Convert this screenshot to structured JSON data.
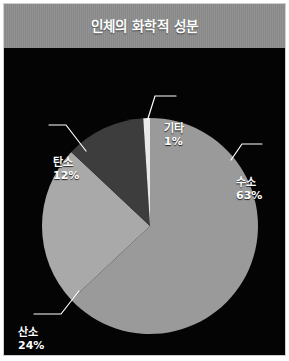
{
  "header": {
    "title": "인체의 화학적 성분"
  },
  "colors": {
    "header_band": "#8e8e8e",
    "plot_background": "#040404",
    "frame_border": "#cfcfcf",
    "label_text": "#ffffff",
    "leader_line": "#ffffff",
    "hydrogen": "#9a9a9a",
    "oxygen": "#a9a9a9",
    "carbon": "#3d3d3d",
    "other": "#e9e9e9"
  },
  "chart_data": {
    "type": "pie",
    "title": "인체의 화학적 성분",
    "xlabel": "",
    "ylabel": "",
    "legend_position": "none",
    "labels_outside": true,
    "start_angle_deg": 0,
    "direction": "clockwise",
    "categories": [
      "수소",
      "산소",
      "탄소",
      "기타"
    ],
    "values": [
      63,
      24,
      12,
      1
    ],
    "unit": "%",
    "slices": [
      {
        "label": "수소",
        "value": 63,
        "value_text": "63%",
        "color": "#9a9a9a"
      },
      {
        "label": "산소",
        "value": 24,
        "value_text": "24%",
        "color": "#a9a9a9"
      },
      {
        "label": "탄소",
        "value": 12,
        "value_text": "12%",
        "color": "#3d3d3d"
      },
      {
        "label": "기타",
        "value": 1,
        "value_text": "1%",
        "color": "#e9e9e9"
      }
    ]
  },
  "labels": {
    "hydrogen": {
      "name": "수소",
      "pct": "63%"
    },
    "oxygen": {
      "name": "산소",
      "pct": "24%"
    },
    "carbon": {
      "name": "탄소",
      "pct": "12%"
    },
    "other": {
      "name": "기타",
      "pct": "1%"
    }
  }
}
